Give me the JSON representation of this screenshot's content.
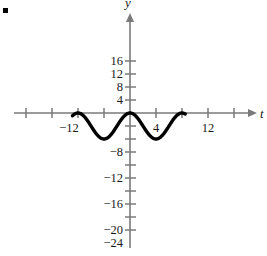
{
  "figure": {
    "bullet_marker": "■",
    "axis_labels": {
      "x": "t",
      "y": "y"
    },
    "line_color": "#000000",
    "axis_color": "#7a7a7a",
    "text_color": "#1a1a1a",
    "background": "#ffffff"
  },
  "chart_data": {
    "type": "line",
    "title": "",
    "xlabel": "t",
    "ylabel": "y",
    "xlim": [
      -20,
      20
    ],
    "ylim": [
      -26,
      18
    ],
    "grid": false,
    "legend": null,
    "x_ticks": [
      -16,
      -12,
      -8,
      -4,
      4,
      8,
      12,
      16
    ],
    "x_tick_labels": [
      "",
      "-12",
      "",
      "",
      "4",
      "",
      "12",
      ""
    ],
    "y_ticks": [
      16,
      12,
      8,
      4,
      -4,
      -8,
      -12,
      -16,
      -20,
      -24
    ],
    "y_tick_labels": [
      "16",
      "12",
      "8",
      "4",
      "",
      "-8",
      "-12",
      "-16",
      "-20",
      "-24"
    ],
    "x_visible_labels": [
      {
        "value": -12,
        "text": "−12"
      },
      {
        "value": 4,
        "text": "4"
      },
      {
        "value": 12,
        "text": "12"
      }
    ],
    "y_visible_labels": [
      {
        "value": 16,
        "text": "16"
      },
      {
        "value": 12,
        "text": "12"
      },
      {
        "value": 8,
        "text": "8"
      },
      {
        "value": 4,
        "text": "4"
      },
      {
        "value": -8,
        "text": "−8"
      },
      {
        "value": -12,
        "text": "−12"
      },
      {
        "value": -16,
        "text": "−16"
      },
      {
        "value": -20,
        "text": "−20"
      },
      {
        "value": -24,
        "text": "−24"
      }
    ],
    "curve": {
      "description": "cosine wave, amplitude 4, midline -4, period 16, maximum 0 at t=0, minima -8 at t=-8 and t=8",
      "amplitude": 4,
      "midline": -4,
      "period": 16,
      "phase": 0,
      "maximum": 0,
      "minimum": -8,
      "x_range": [
        -17.7,
        17
      ],
      "x": [
        -17.7,
        -16,
        -14,
        -12,
        -10,
        -8,
        -6,
        -4,
        -2,
        0,
        2,
        4,
        6,
        8,
        10,
        12,
        14,
        16,
        17
      ],
      "y": [
        -0.5,
        0,
        -1.1,
        -3.1,
        -5.7,
        -8,
        -6.8,
        -4,
        -1.2,
        0,
        -1.2,
        -4,
        -6.8,
        -8,
        -5.7,
        -3.1,
        -1.1,
        0,
        -0.5
      ]
    }
  }
}
